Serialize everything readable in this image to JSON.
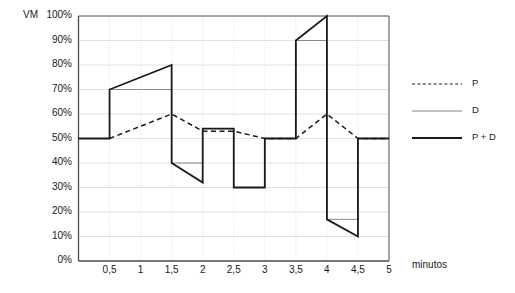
{
  "chart_data": {
    "type": "line",
    "title": "",
    "ylabel": "VM",
    "xlabel": "minutos",
    "ylim": [
      0,
      100
    ],
    "xlim": [
      0,
      5
    ],
    "grid": true,
    "legend_position": "right",
    "y_ticks": [
      "0%",
      "10%",
      "20%",
      "30%",
      "40%",
      "50%",
      "60%",
      "70%",
      "80%",
      "90%",
      "100%"
    ],
    "y_tick_values": [
      0,
      10,
      20,
      30,
      40,
      50,
      60,
      70,
      80,
      90,
      100
    ],
    "x_ticks": [
      "0,5",
      "1",
      "1,5",
      "2",
      "2,5",
      "3",
      "3,5",
      "4",
      "4,5",
      "5"
    ],
    "x_tick_values": [
      0.5,
      1,
      1.5,
      2,
      2.5,
      3,
      3.5,
      4,
      4.5,
      5
    ],
    "series": [
      {
        "name": "P",
        "style": "dashed",
        "color": "#1a1a1a",
        "points": [
          [
            0.5,
            50
          ],
          [
            1.5,
            60
          ],
          [
            2.0,
            53
          ],
          [
            2.5,
            53
          ],
          [
            3.0,
            50
          ],
          [
            3.5,
            50
          ],
          [
            4.0,
            60
          ],
          [
            4.5,
            50
          ],
          [
            5.0,
            50
          ]
        ]
      },
      {
        "name": "D",
        "style": "thin",
        "color": "#808080",
        "points": [
          [
            0.5,
            70
          ],
          [
            1.5,
            70
          ],
          [
            1.5,
            40
          ],
          [
            2.0,
            40
          ],
          [
            2.0,
            54
          ],
          [
            2.5,
            54
          ],
          [
            2.5,
            30
          ],
          [
            3.0,
            30
          ],
          [
            3.0,
            50
          ],
          [
            3.5,
            50
          ],
          [
            3.5,
            90
          ],
          [
            4.0,
            90
          ],
          [
            4.0,
            17
          ],
          [
            4.5,
            17
          ],
          [
            4.5,
            50
          ],
          [
            5.0,
            50
          ]
        ]
      },
      {
        "name": "P + D",
        "style": "thick",
        "color": "#1a1a1a",
        "points": [
          [
            0.0,
            50
          ],
          [
            0.5,
            50
          ],
          [
            0.5,
            70
          ],
          [
            1.5,
            80
          ],
          [
            1.5,
            40
          ],
          [
            2.0,
            32
          ],
          [
            2.0,
            54
          ],
          [
            2.5,
            54
          ],
          [
            2.5,
            30
          ],
          [
            3.0,
            30
          ],
          [
            3.0,
            50
          ],
          [
            3.5,
            50
          ],
          [
            3.5,
            90
          ],
          [
            4.0,
            100
          ],
          [
            4.0,
            17
          ],
          [
            4.5,
            10
          ],
          [
            4.5,
            50
          ],
          [
            5.0,
            50
          ]
        ]
      }
    ],
    "legend": [
      {
        "label": "P",
        "style": "dashed"
      },
      {
        "label": "D",
        "style": "thin"
      },
      {
        "label": "P + D",
        "style": "thick"
      }
    ]
  }
}
